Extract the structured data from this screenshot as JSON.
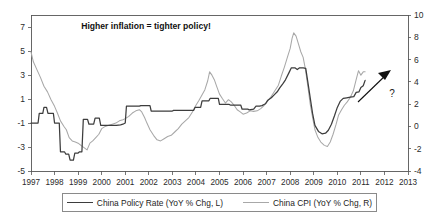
{
  "chart_data": {
    "type": "line",
    "title": "",
    "annotation": "Higher inflation = tighter policy!",
    "question_marker": "?",
    "xlabel": "",
    "ylabel": "",
    "grid": false,
    "legend_position": "bottom",
    "x_axis": {
      "ticks": [
        "1997",
        "1998",
        "1999",
        "2000",
        "2001",
        "2002",
        "2003",
        "2004",
        "2005",
        "2006",
        "2007",
        "2008",
        "2009",
        "2010",
        "2011",
        "2012",
        "2013"
      ],
      "min": 1997,
      "max": 2013
    },
    "y_axis_left": {
      "label": "China Policy Rate (YoY % Chg, L)",
      "ticks": [
        "7",
        "5",
        "3",
        "1",
        "-1",
        "-3",
        "-5"
      ],
      "min": -5,
      "max": 8,
      "ylim": [
        -5,
        8
      ]
    },
    "y_axis_right": {
      "label": "China CPI (YoY % Chg, R)",
      "ticks": [
        "10",
        "8",
        "6",
        "4",
        "2",
        "0",
        "-2",
        "-4"
      ],
      "min": -4,
      "max": 10,
      "ylim": [
        -4,
        10
      ]
    },
    "series": [
      {
        "name": "China Policy Rate (YoY % Chg, L)",
        "axis": "left",
        "color": "#3d3d3d",
        "points": [
          [
            1997.0,
            -1.0
          ],
          [
            1997.3,
            -1.0
          ],
          [
            1997.35,
            -0.2
          ],
          [
            1997.5,
            -0.2
          ],
          [
            1997.55,
            0.3
          ],
          [
            1997.66,
            0.3
          ],
          [
            1997.72,
            -0.2
          ],
          [
            1997.95,
            -0.2
          ],
          [
            1998.0,
            -1.0
          ],
          [
            1998.2,
            -1.0
          ],
          [
            1998.25,
            -3.4
          ],
          [
            1998.42,
            -3.4
          ],
          [
            1998.48,
            -3.6
          ],
          [
            1998.6,
            -3.6
          ],
          [
            1998.66,
            -4.1
          ],
          [
            1998.8,
            -4.1
          ],
          [
            1998.86,
            -3.5
          ],
          [
            1999.0,
            -3.5
          ],
          [
            1999.06,
            -3.4
          ],
          [
            1999.16,
            -3.4
          ],
          [
            1999.22,
            -0.7
          ],
          [
            1999.4,
            -0.7
          ],
          [
            1999.46,
            -1.1
          ],
          [
            1999.66,
            -1.1
          ],
          [
            1999.72,
            -0.6
          ],
          [
            1999.9,
            -0.6
          ],
          [
            1999.96,
            -1.2
          ],
          [
            2000.55,
            -1.2
          ],
          [
            2000.62,
            -1.2
          ],
          [
            2000.8,
            -1.15
          ],
          [
            2000.9,
            -1.1
          ],
          [
            2001.0,
            -1.0
          ],
          [
            2001.05,
            0.4
          ],
          [
            2001.6,
            0.4
          ],
          [
            2001.66,
            0.45
          ],
          [
            2002.05,
            0.45
          ],
          [
            2002.1,
            0.0
          ],
          [
            2003.0,
            0.0
          ],
          [
            2003.05,
            0.05
          ],
          [
            2003.9,
            0.05
          ],
          [
            2003.96,
            0.3
          ],
          [
            2004.2,
            0.3
          ],
          [
            2004.26,
            0.85
          ],
          [
            2004.55,
            0.85
          ],
          [
            2004.6,
            1.05
          ],
          [
            2004.95,
            1.05
          ],
          [
            2005.0,
            0.55
          ],
          [
            2005.4,
            0.55
          ],
          [
            2005.46,
            0.5
          ],
          [
            2005.9,
            0.5
          ],
          [
            2005.96,
            0.15
          ],
          [
            2006.2,
            0.15
          ],
          [
            2006.26,
            0.1
          ],
          [
            2006.45,
            0.15
          ],
          [
            2006.55,
            0.4
          ],
          [
            2006.7,
            0.4
          ],
          [
            2006.8,
            0.45
          ],
          [
            2006.95,
            0.6
          ],
          [
            2007.05,
            0.9
          ],
          [
            2007.2,
            1.1
          ],
          [
            2007.3,
            1.3
          ],
          [
            2007.45,
            1.6
          ],
          [
            2007.55,
            1.9
          ],
          [
            2007.7,
            2.3
          ],
          [
            2007.8,
            2.6
          ],
          [
            2007.95,
            3.2
          ],
          [
            2008.05,
            3.6
          ],
          [
            2008.2,
            3.6
          ],
          [
            2008.3,
            3.45
          ],
          [
            2008.4,
            3.6
          ],
          [
            2008.55,
            3.6
          ],
          [
            2008.66,
            3.55
          ],
          [
            2008.75,
            2.4
          ],
          [
            2008.85,
            1.1
          ],
          [
            2008.95,
            -0.2
          ],
          [
            2009.05,
            -1.2
          ],
          [
            2009.2,
            -1.7
          ],
          [
            2009.35,
            -1.9
          ],
          [
            2009.5,
            -1.85
          ],
          [
            2009.62,
            -1.6
          ],
          [
            2009.75,
            -1.1
          ],
          [
            2009.88,
            -0.4
          ],
          [
            2010.0,
            0.3
          ],
          [
            2010.12,
            0.8
          ],
          [
            2010.25,
            1.05
          ],
          [
            2010.4,
            1.1
          ],
          [
            2010.55,
            1.15
          ],
          [
            2010.7,
            1.2
          ],
          [
            2010.8,
            1.55
          ],
          [
            2010.92,
            1.6
          ],
          [
            2011.0,
            1.95
          ],
          [
            2011.1,
            2.1
          ],
          [
            2011.18,
            2.55
          ]
        ]
      },
      {
        "name": "China CPI (YoY % Chg, R)",
        "axis": "right",
        "color": "#a8a8a8",
        "points": [
          [
            1997.0,
            6.7
          ],
          [
            1997.1,
            5.8
          ],
          [
            1997.25,
            5.1
          ],
          [
            1997.4,
            4.4
          ],
          [
            1997.55,
            3.6
          ],
          [
            1997.7,
            3.1
          ],
          [
            1997.85,
            2.4
          ],
          [
            1998.0,
            1.8
          ],
          [
            1998.12,
            1.2
          ],
          [
            1998.25,
            0.5
          ],
          [
            1998.4,
            0.0
          ],
          [
            1998.5,
            -0.3
          ],
          [
            1998.62,
            -1.0
          ],
          [
            1998.75,
            -1.3
          ],
          [
            1998.88,
            -1.4
          ],
          [
            1999.0,
            -1.5
          ],
          [
            1999.12,
            -1.7
          ],
          [
            1999.25,
            -1.9
          ],
          [
            1999.38,
            -2.1
          ],
          [
            1999.5,
            -1.5
          ],
          [
            1999.62,
            -1.3
          ],
          [
            1999.75,
            -1.0
          ],
          [
            1999.88,
            -0.7
          ],
          [
            2000.0,
            -0.2
          ],
          [
            2000.15,
            0.0
          ],
          [
            2000.3,
            0.1
          ],
          [
            2000.45,
            0.2
          ],
          [
            2000.6,
            0.3
          ],
          [
            2000.75,
            0.5
          ],
          [
            2000.9,
            0.6
          ],
          [
            2001.0,
            0.7
          ],
          [
            2001.15,
            0.9
          ],
          [
            2001.3,
            1.2
          ],
          [
            2001.45,
            1.4
          ],
          [
            2001.6,
            1.5
          ],
          [
            2001.7,
            1.3
          ],
          [
            2001.82,
            0.8
          ],
          [
            2001.92,
            0.3
          ],
          [
            2002.05,
            -0.3
          ],
          [
            2002.2,
            -0.8
          ],
          [
            2002.35,
            -1.2
          ],
          [
            2002.5,
            -1.3
          ],
          [
            2002.65,
            -1.1
          ],
          [
            2002.8,
            -0.9
          ],
          [
            2002.95,
            -0.8
          ],
          [
            2003.1,
            -0.5
          ],
          [
            2003.25,
            -0.2
          ],
          [
            2003.4,
            0.2
          ],
          [
            2003.55,
            0.5
          ],
          [
            2003.7,
            0.8
          ],
          [
            2003.85,
            1.3
          ],
          [
            2004.0,
            1.9
          ],
          [
            2004.12,
            2.3
          ],
          [
            2004.25,
            2.8
          ],
          [
            2004.38,
            3.3
          ],
          [
            2004.5,
            4.1
          ],
          [
            2004.58,
            4.9
          ],
          [
            2004.68,
            4.6
          ],
          [
            2004.78,
            4.2
          ],
          [
            2004.88,
            3.6
          ],
          [
            2005.0,
            2.9
          ],
          [
            2005.12,
            2.5
          ],
          [
            2005.25,
            2.1
          ],
          [
            2005.38,
            2.4
          ],
          [
            2005.5,
            2.2
          ],
          [
            2005.62,
            1.9
          ],
          [
            2005.75,
            1.5
          ],
          [
            2005.88,
            1.3
          ],
          [
            2006.0,
            1.1
          ],
          [
            2006.15,
            1.2
          ],
          [
            2006.3,
            1.4
          ],
          [
            2006.45,
            1.35
          ],
          [
            2006.6,
            1.4
          ],
          [
            2006.75,
            1.6
          ],
          [
            2006.9,
            1.9
          ],
          [
            2007.05,
            2.3
          ],
          [
            2007.2,
            2.7
          ],
          [
            2007.35,
            3.2
          ],
          [
            2007.5,
            3.7
          ],
          [
            2007.62,
            4.5
          ],
          [
            2007.75,
            5.3
          ],
          [
            2007.88,
            6.2
          ],
          [
            2008.0,
            7.0
          ],
          [
            2008.08,
            7.9
          ],
          [
            2008.15,
            8.4
          ],
          [
            2008.25,
            8.1
          ],
          [
            2008.35,
            7.4
          ],
          [
            2008.45,
            6.7
          ],
          [
            2008.55,
            6.2
          ],
          [
            2008.65,
            5.1
          ],
          [
            2008.75,
            3.6
          ],
          [
            2008.85,
            2.0
          ],
          [
            2008.95,
            0.8
          ],
          [
            2009.05,
            -0.3
          ],
          [
            2009.18,
            -1.0
          ],
          [
            2009.3,
            -1.4
          ],
          [
            2009.45,
            -1.7
          ],
          [
            2009.58,
            -1.8
          ],
          [
            2009.7,
            -1.4
          ],
          [
            2009.82,
            -0.7
          ],
          [
            2009.95,
            0.2
          ],
          [
            2010.05,
            1.0
          ],
          [
            2010.18,
            1.5
          ],
          [
            2010.3,
            1.9
          ],
          [
            2010.42,
            2.2
          ],
          [
            2010.55,
            2.6
          ],
          [
            2010.68,
            3.2
          ],
          [
            2010.8,
            4.2
          ],
          [
            2010.9,
            5.0
          ],
          [
            2011.0,
            4.6
          ],
          [
            2011.1,
            4.9
          ],
          [
            2011.18,
            4.9
          ]
        ]
      }
    ]
  },
  "legend": {
    "items": [
      {
        "label": "China Policy Rate (YoY % Chg, L)",
        "color": "#3d3d3d"
      },
      {
        "label": "China CPI (YoY % Chg, R)",
        "color": "#a8a8a8"
      }
    ]
  }
}
